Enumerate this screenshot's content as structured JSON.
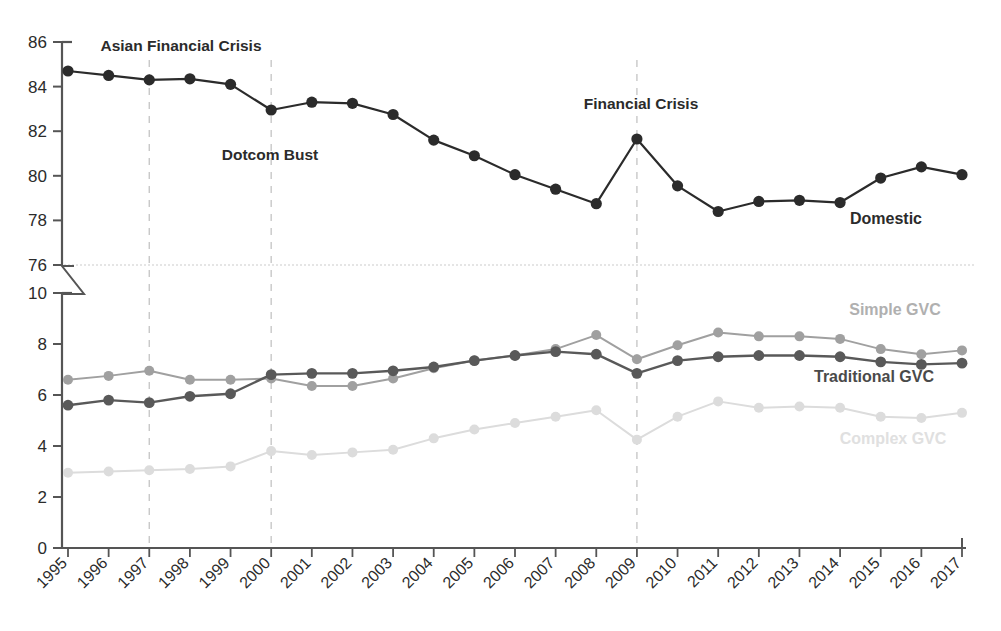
{
  "chart_data": {
    "type": "line",
    "title": "",
    "xlabel": "",
    "ylabel": "",
    "grid": false,
    "legend_position": "inline-right",
    "broken_axis": true,
    "x": [
      1995,
      1996,
      1997,
      1998,
      1999,
      2000,
      2001,
      2002,
      2003,
      2004,
      2005,
      2006,
      2007,
      2008,
      2009,
      2010,
      2011,
      2012,
      2013,
      2014,
      2015,
      2016,
      2017
    ],
    "panels": [
      {
        "name": "upper",
        "ylim": [
          76,
          86
        ],
        "yticks": [
          76,
          78,
          80,
          82,
          84,
          86
        ],
        "series": [
          {
            "name": "Domestic",
            "color": "#2b2b2b",
            "marker": "circle",
            "values": [
              84.7,
              84.5,
              84.3,
              84.35,
              84.1,
              82.95,
              83.3,
              83.25,
              82.75,
              81.6,
              80.9,
              80.05,
              79.4,
              78.75,
              81.65,
              79.55,
              78.4,
              78.85,
              78.9,
              78.8,
              79.9,
              80.4,
              80.05
            ]
          }
        ]
      },
      {
        "name": "lower",
        "ylim": [
          0,
          10
        ],
        "yticks": [
          0,
          2,
          4,
          6,
          8,
          10
        ],
        "series": [
          {
            "name": "Traditional GVC",
            "color": "#595959",
            "marker": "circle",
            "values": [
              5.6,
              5.8,
              5.7,
              5.95,
              6.05,
              6.8,
              6.85,
              6.85,
              6.95,
              7.1,
              7.35,
              7.55,
              7.7,
              7.6,
              6.85,
              7.35,
              7.5,
              7.55,
              7.55,
              7.5,
              7.3,
              7.2,
              7.25
            ]
          },
          {
            "name": "Simple GVC",
            "color": "#a0a0a0",
            "marker": "circle",
            "values": [
              6.6,
              6.75,
              6.95,
              6.6,
              6.6,
              6.65,
              6.35,
              6.35,
              6.65,
              7.05,
              7.35,
              7.55,
              7.8,
              8.35,
              7.4,
              7.95,
              8.45,
              8.3,
              8.3,
              8.2,
              7.8,
              7.6,
              7.75
            ]
          },
          {
            "name": "Complex GVC",
            "color": "#dcdcdc",
            "marker": "circle",
            "values": [
              2.95,
              3.0,
              3.05,
              3.1,
              3.2,
              3.8,
              3.65,
              3.75,
              3.85,
              4.3,
              4.65,
              4.9,
              5.15,
              5.4,
              4.25,
              5.15,
              5.75,
              5.5,
              5.55,
              5.5,
              5.15,
              5.1,
              5.3
            ]
          }
        ]
      }
    ],
    "annotations": [
      {
        "label": "Asian Financial Crisis",
        "year": 1997,
        "panel": "upper",
        "text_x": 181,
        "text_y": 51,
        "anchor": "middle",
        "color": "#2b2b2b"
      },
      {
        "label": "Dotcom Bust",
        "year": 2000,
        "panel": "upper",
        "text_x": 270,
        "text_y": 160,
        "anchor": "middle",
        "color": "#2b2b2b"
      },
      {
        "label": "Financial Crisis",
        "year": 2009,
        "panel": "upper",
        "text_x": 641,
        "text_y": 109,
        "anchor": "middle",
        "color": "#2b2b2b"
      }
    ],
    "event_lines": [
      1997,
      2000,
      2009
    ],
    "series_labels": [
      {
        "label": "Domestic",
        "x": 886,
        "y": 224,
        "color": "#2b2b2b"
      },
      {
        "label": "Simple GVC",
        "x": 895,
        "y": 315,
        "color": "#b0b0b0"
      },
      {
        "label": "Traditional GVC",
        "x": 874,
        "y": 382,
        "color": "#4a4a4a"
      },
      {
        "label": "Complex GVC",
        "x": 893,
        "y": 444,
        "color": "#e0e0e0"
      }
    ],
    "colors": {
      "domestic": "#2b2b2b",
      "traditional_gvc": "#595959",
      "simple_gvc": "#a0a0a0",
      "complex_gvc": "#dcdcdc",
      "axis": "#555555",
      "event_line": "#c8c8c8",
      "separator": "#cccccc",
      "background": "#ffffff"
    }
  }
}
